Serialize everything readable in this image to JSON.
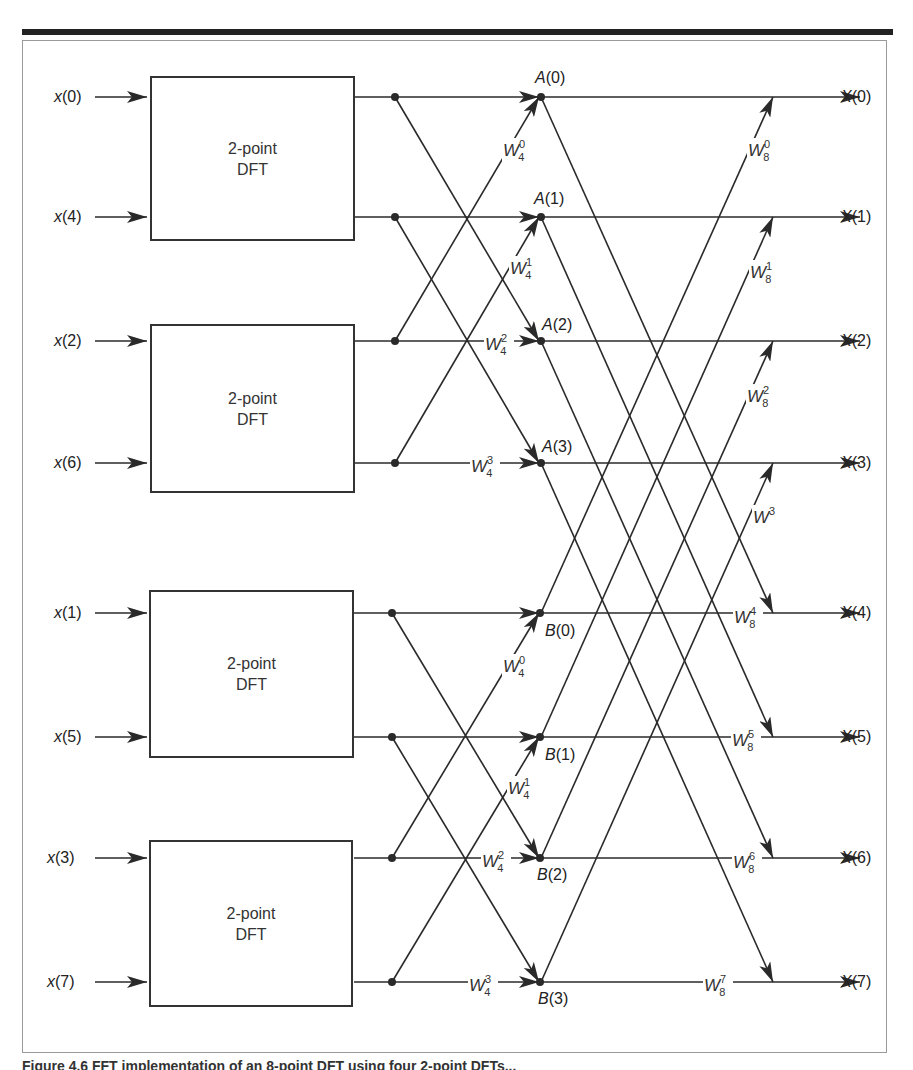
{
  "figure": {
    "dft_block_label_line1": "2-point",
    "dft_block_label_line2": "DFT",
    "caption": "Figure 4.6 FFT implementation of an 8-point DFT using four 2-point DFTs..."
  },
  "inputs": [
    {
      "var": "x",
      "idx": "(0)"
    },
    {
      "var": "x",
      "idx": "(4)"
    },
    {
      "var": "x",
      "idx": "(2)"
    },
    {
      "var": "x",
      "idx": "(6)"
    },
    {
      "var": "x",
      "idx": "(1)"
    },
    {
      "var": "x",
      "idx": "(5)"
    },
    {
      "var": "x",
      "idx": "(3)"
    },
    {
      "var": "x",
      "idx": "(7)"
    }
  ],
  "dft_blocks": [
    {
      "line1": "2-point",
      "line2": "DFT",
      "inputs": [
        "x(0)",
        "x(4)"
      ]
    },
    {
      "line1": "2-point",
      "line2": "DFT",
      "inputs": [
        "x(2)",
        "x(6)"
      ]
    },
    {
      "line1": "2-point",
      "line2": "DFT",
      "inputs": [
        "x(1)",
        "x(5)"
      ]
    },
    {
      "line1": "2-point",
      "line2": "DFT",
      "inputs": [
        "x(3)",
        "x(7)"
      ]
    }
  ],
  "intermediate_nodes": [
    {
      "var": "A",
      "idx": "(0)"
    },
    {
      "var": "A",
      "idx": "(1)"
    },
    {
      "var": "A",
      "idx": "(2)"
    },
    {
      "var": "A",
      "idx": "(3)"
    },
    {
      "var": "B",
      "idx": "(0)"
    },
    {
      "var": "B",
      "idx": "(1)"
    },
    {
      "var": "B",
      "idx": "(2)"
    },
    {
      "var": "B",
      "idx": "(3)"
    }
  ],
  "twiddles_stage2": [
    {
      "base": "W",
      "sup": "0",
      "sub": "4"
    },
    {
      "base": "W",
      "sup": "1",
      "sub": "4"
    },
    {
      "base": "W",
      "sup": "2",
      "sub": "4"
    },
    {
      "base": "W",
      "sup": "3",
      "sub": "4"
    },
    {
      "base": "W",
      "sup": "0",
      "sub": "4"
    },
    {
      "base": "W",
      "sup": "1",
      "sub": "4"
    },
    {
      "base": "W",
      "sup": "2",
      "sub": "4"
    },
    {
      "base": "W",
      "sup": "3",
      "sub": "4"
    }
  ],
  "twiddles_stage3": [
    {
      "base": "W",
      "sup": "0",
      "sub": "8"
    },
    {
      "base": "W",
      "sup": "1",
      "sub": "8"
    },
    {
      "base": "W",
      "sup": "2",
      "sub": "8"
    },
    {
      "base": "W",
      "sup": "3",
      "sub": "8"
    },
    {
      "base": "W",
      "sup": "4",
      "sub": "8"
    },
    {
      "base": "W",
      "sup": "5",
      "sub": "8"
    },
    {
      "base": "W",
      "sup": "6",
      "sub": "8"
    },
    {
      "base": "W",
      "sup": "7",
      "sub": "8"
    }
  ],
  "outputs": [
    {
      "var": "X",
      "idx": "(0)"
    },
    {
      "var": "X",
      "idx": "(1)"
    },
    {
      "var": "X",
      "idx": "(2)"
    },
    {
      "var": "X",
      "idx": "(3)"
    },
    {
      "var": "X",
      "idx": "(4)"
    },
    {
      "var": "X",
      "idx": "(5)"
    },
    {
      "var": "X",
      "idx": "(6)"
    },
    {
      "var": "X",
      "idx": "(7)"
    }
  ],
  "colors": {
    "line": "#2a2a2a",
    "frame": "#9a9a9a",
    "background": "#ffffff"
  }
}
